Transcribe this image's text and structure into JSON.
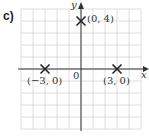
{
  "part_label": "c)",
  "axes": {
    "x_label": "x",
    "y_label": "y",
    "origin_label": "0"
  },
  "grid": {
    "x_min": -5,
    "x_max": 5,
    "y_min": -5,
    "y_max": 5,
    "step": 1
  },
  "points": [
    {
      "label": "(0, 4)",
      "x": 0,
      "y": 4
    },
    {
      "label": "(−3, 0)",
      "x": -3,
      "y": 0
    },
    {
      "label": "(3, 0)",
      "x": 3,
      "y": 0
    }
  ],
  "colors": {
    "grid": "#d6d6d6",
    "axis": "#333333",
    "marker": "#222222"
  }
}
